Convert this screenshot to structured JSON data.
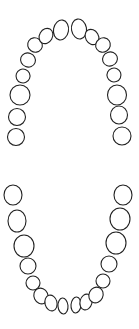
{
  "diagram": {
    "stroke_color": "#222222",
    "fill_color": "#ffffff",
    "upper_arch": [
      {
        "id": "upper-left-third-molar",
        "cx": 16,
        "cy": 137,
        "rx": 8.5,
        "ry": 8.5,
        "rot": 0
      },
      {
        "id": "upper-left-second-molar",
        "cx": 17,
        "cy": 117,
        "rx": 8.5,
        "ry": 8.5,
        "rot": 0
      },
      {
        "id": "upper-left-first-molar",
        "cx": 20,
        "cy": 95,
        "rx": 10,
        "ry": 10,
        "rot": 0
      },
      {
        "id": "upper-left-second-premolar",
        "cx": 23,
        "cy": 76,
        "rx": 7,
        "ry": 7,
        "rot": 20
      },
      {
        "id": "upper-left-first-premolar",
        "cx": 28,
        "cy": 60,
        "rx": 7.5,
        "ry": 7,
        "rot": 20
      },
      {
        "id": "upper-left-canine",
        "cx": 35,
        "cy": 45,
        "rx": 7.5,
        "ry": 7,
        "rot": 35
      },
      {
        "id": "upper-left-lateral-incisor",
        "cx": 46,
        "cy": 36,
        "rx": 6.5,
        "ry": 8,
        "rot": 30
      },
      {
        "id": "upper-left-central-incisor",
        "cx": 61,
        "cy": 30,
        "rx": 7.5,
        "ry": 10,
        "rot": 10
      },
      {
        "id": "upper-right-central-incisor",
        "cx": 79,
        "cy": 29,
        "rx": 7.5,
        "ry": 10,
        "rot": -10
      },
      {
        "id": "upper-right-lateral-incisor",
        "cx": 92,
        "cy": 37,
        "rx": 6.5,
        "ry": 8,
        "rot": -30
      },
      {
        "id": "upper-right-canine",
        "cx": 103,
        "cy": 45,
        "rx": 7.5,
        "ry": 7,
        "rot": -35
      },
      {
        "id": "upper-right-first-premolar",
        "cx": 110,
        "cy": 59,
        "rx": 7.5,
        "ry": 7,
        "rot": -20
      },
      {
        "id": "upper-right-second-premolar",
        "cx": 114,
        "cy": 75,
        "rx": 7,
        "ry": 7,
        "rot": -20
      },
      {
        "id": "upper-right-first-molar",
        "cx": 117,
        "cy": 95,
        "rx": 9.5,
        "ry": 10,
        "rot": 0
      },
      {
        "id": "upper-right-second-molar",
        "cx": 119,
        "cy": 115,
        "rx": 8.5,
        "ry": 9,
        "rot": 0
      },
      {
        "id": "upper-right-third-molar",
        "cx": 122,
        "cy": 136,
        "rx": 9,
        "ry": 9,
        "rot": 0
      }
    ],
    "lower_arch": [
      {
        "id": "lower-left-third-molar",
        "cx": 13,
        "cy": 195,
        "rx": 9,
        "ry": 10,
        "rot": 0
      },
      {
        "id": "lower-left-second-molar",
        "cx": 17,
        "cy": 221,
        "rx": 9,
        "ry": 11,
        "rot": 0
      },
      {
        "id": "lower-left-first-molar",
        "cx": 24,
        "cy": 246,
        "rx": 10,
        "ry": 11,
        "rot": 0
      },
      {
        "id": "lower-left-second-premolar",
        "cx": 28,
        "cy": 266,
        "rx": 8,
        "ry": 8,
        "rot": 0
      },
      {
        "id": "lower-left-first-premolar",
        "cx": 33,
        "cy": 283,
        "rx": 7,
        "ry": 7,
        "rot": 0
      },
      {
        "id": "lower-left-canine",
        "cx": 41,
        "cy": 296,
        "rx": 7,
        "ry": 8,
        "rot": -25
      },
      {
        "id": "lower-left-lateral-incisor",
        "cx": 51,
        "cy": 303,
        "rx": 6,
        "ry": 8,
        "rot": -15
      },
      {
        "id": "lower-left-central-incisor",
        "cx": 63,
        "cy": 306,
        "rx": 5,
        "ry": 8,
        "rot": -5
      },
      {
        "id": "lower-right-central-incisor",
        "cx": 76,
        "cy": 305,
        "rx": 5,
        "ry": 8,
        "rot": 5
      },
      {
        "id": "lower-right-lateral-incisor",
        "cx": 86,
        "cy": 302,
        "rx": 6,
        "ry": 8,
        "rot": 15
      },
      {
        "id": "lower-right-canine",
        "cx": 96,
        "cy": 295,
        "rx": 7,
        "ry": 8,
        "rot": 25
      },
      {
        "id": "lower-right-first-premolar",
        "cx": 103,
        "cy": 281,
        "rx": 7,
        "ry": 7,
        "rot": 0
      },
      {
        "id": "lower-right-second-premolar",
        "cx": 109,
        "cy": 264,
        "rx": 8,
        "ry": 8,
        "rot": 0
      },
      {
        "id": "lower-right-first-molar",
        "cx": 116,
        "cy": 243,
        "rx": 10,
        "ry": 11,
        "rot": 0
      },
      {
        "id": "lower-right-second-molar",
        "cx": 120,
        "cy": 219,
        "rx": 10,
        "ry": 11,
        "rot": 0
      },
      {
        "id": "lower-right-third-molar",
        "cx": 123,
        "cy": 195,
        "rx": 9,
        "ry": 10,
        "rot": 0
      }
    ]
  }
}
